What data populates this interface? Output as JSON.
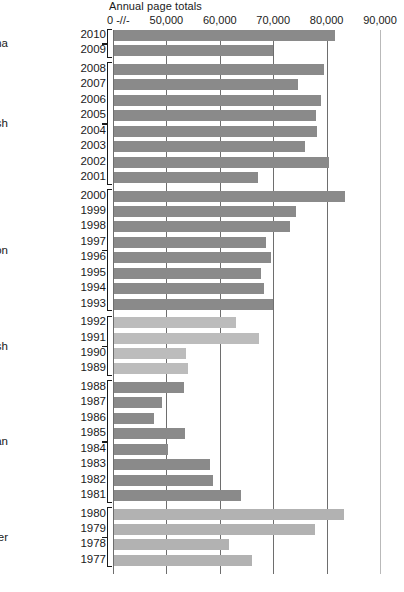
{
  "chart": {
    "title": "Annual page totals",
    "axis_break_glyph": "0 -//-"
  },
  "chart_data": {
    "type": "bar",
    "orientation": "horizontal",
    "title": "Annual page totals",
    "xlabel": "",
    "ylabel": "",
    "xlim": [
      40000,
      92000
    ],
    "axis_break": true,
    "axis_break_note": "Axis broken between 0 and 50,000",
    "grid": true,
    "grid_axis": "x",
    "legend_position": "none",
    "xticks": [
      0,
      50000,
      60000,
      70000,
      80000,
      90000
    ],
    "xticklabels": [
      "0 -//-",
      "50,000",
      "60,000",
      "70,000",
      "80,000",
      "90,000"
    ],
    "categories": [
      "2010",
      "2009",
      "2008",
      "2007",
      "2006",
      "2005",
      "2004",
      "2003",
      "2002",
      "2001",
      "2000",
      "1999",
      "1998",
      "1997",
      "1996",
      "1995",
      "1994",
      "1993",
      "1992",
      "1991",
      "1990",
      "1989",
      "1988",
      "1987",
      "1986",
      "1985",
      "1984",
      "1983",
      "1982",
      "1981",
      "1980",
      "1979",
      "1978",
      "1977"
    ],
    "values": [
      81400,
      69700,
      79400,
      74500,
      78700,
      77800,
      78000,
      75700,
      80300,
      67000,
      83300,
      74000,
      73000,
      68500,
      69400,
      67500,
      68100,
      69700,
      62900,
      67200,
      53500,
      53800,
      53200,
      49000,
      47400,
      53300,
      50200,
      57900,
      58500,
      63700,
      83000,
      77700,
      61500,
      65800
    ],
    "groups": [
      {
        "name": "Obama",
        "years": [
          "2010",
          "2009"
        ],
        "color": "#8a8a8a"
      },
      {
        "name": "G.W. Bush",
        "years": [
          "2008",
          "2007",
          "2006",
          "2005",
          "2004",
          "2003",
          "2002",
          "2001"
        ],
        "color": "#8a8a8a"
      },
      {
        "name": "Clinton",
        "years": [
          "2000",
          "1999",
          "1998",
          "1997",
          "1996",
          "1995",
          "1994",
          "1993"
        ],
        "color": "#8a8a8a"
      },
      {
        "name": "G.H.W. Bush",
        "years": [
          "1992",
          "1991",
          "1990",
          "1989"
        ],
        "color": "#bcbcbc"
      },
      {
        "name": "Reagan",
        "years": [
          "1988",
          "1987",
          "1986",
          "1985",
          "1984",
          "1983",
          "1982",
          "1981"
        ],
        "color": "#8a8a8a"
      },
      {
        "name": "Carter",
        "years": [
          "1980",
          "1979",
          "1978",
          "1977"
        ],
        "color": "#b2b2b2"
      }
    ],
    "colors": {
      "bar_dark": "#8a8a8a",
      "bar_light": "#bcbcbc",
      "bar_light_alt": "#b2b2b2",
      "gridline": "#6e6e6e",
      "gridline_light": "#b9b9b9",
      "text": "#1a1a1a",
      "background": "#ffffff"
    }
  }
}
